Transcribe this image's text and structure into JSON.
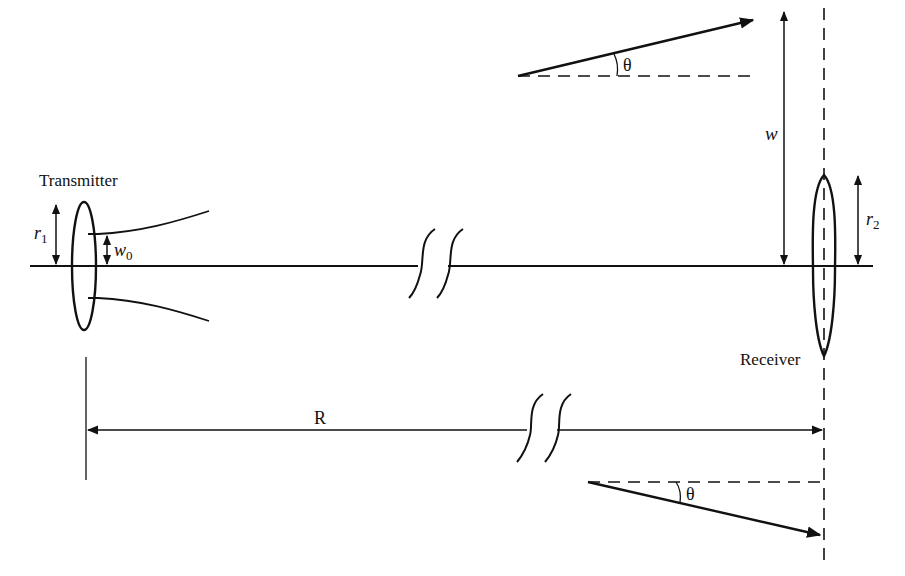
{
  "diagram": {
    "labels": {
      "transmitter": "Transmitter",
      "receiver": "Receiver",
      "r1": "r",
      "r1_sub": "1",
      "r2": "r",
      "r2_sub": "2",
      "w0": "w",
      "w0_sub": "0",
      "w": "w",
      "R": "R",
      "theta_top": "θ",
      "theta_bottom": "θ"
    },
    "colors": {
      "stroke": "#111111",
      "background": "#ffffff"
    }
  }
}
